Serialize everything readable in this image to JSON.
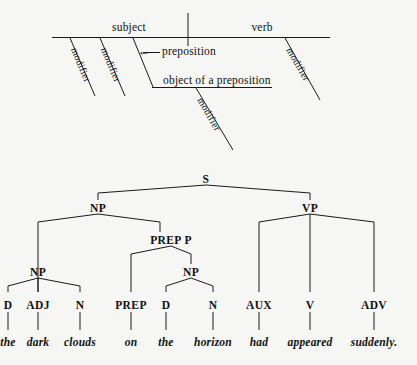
{
  "page": {
    "background_color": "#f6f6f4",
    "ink_color": "#111111",
    "width": 417,
    "height": 365
  },
  "diagram_sentence": {
    "title": "Reed-Kellogg sentence diagram template",
    "baseline_labels": [
      {
        "id": "subject",
        "text": "subject"
      },
      {
        "id": "verb",
        "text": "verb"
      }
    ],
    "modifier_labels": [
      {
        "id": "modifier-subject-1",
        "text": "modifier"
      },
      {
        "id": "modifier-subject-2",
        "text": "modifier"
      },
      {
        "id": "modifier-verb",
        "text": "modifier"
      },
      {
        "id": "modifier-object",
        "text": "modifier"
      }
    ],
    "preposition_label": "preposition",
    "preposition_arrow": "←",
    "object_label": "object of a preposition"
  },
  "tree": {
    "title": "Phrase structure tree",
    "nodes": [
      {
        "id": "s",
        "text": "S"
      },
      {
        "id": "np-top",
        "text": "NP"
      },
      {
        "id": "vp",
        "text": "VP"
      },
      {
        "id": "prep-p",
        "text": "PREP  P"
      },
      {
        "id": "np-left",
        "text": "NP"
      },
      {
        "id": "np-obj",
        "text": "NP"
      }
    ],
    "preterminals": [
      {
        "id": "d1",
        "text": "D"
      },
      {
        "id": "adj",
        "text": "ADJ"
      },
      {
        "id": "n1",
        "text": "N"
      },
      {
        "id": "prep",
        "text": "PREP"
      },
      {
        "id": "d2",
        "text": "D"
      },
      {
        "id": "n2",
        "text": "N"
      },
      {
        "id": "aux",
        "text": "AUX"
      },
      {
        "id": "v",
        "text": "V"
      },
      {
        "id": "adv",
        "text": "ADV"
      }
    ],
    "words": [
      {
        "id": "w-the-1",
        "text": "the"
      },
      {
        "id": "w-dark",
        "text": "dark"
      },
      {
        "id": "w-clouds",
        "text": "clouds"
      },
      {
        "id": "w-on",
        "text": "on"
      },
      {
        "id": "w-the-2",
        "text": "the"
      },
      {
        "id": "w-horizon",
        "text": "horizon"
      },
      {
        "id": "w-had",
        "text": "had"
      },
      {
        "id": "w-appeared",
        "text": "appeared"
      },
      {
        "id": "w-suddenly",
        "text": "suddenly."
      }
    ],
    "sentence": "the dark clouds on the horizon had appeared suddenly."
  }
}
